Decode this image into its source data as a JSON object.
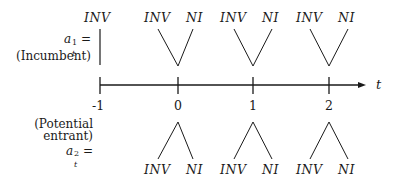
{
  "diagram": {
    "type": "timeline-game-tree",
    "axis": {
      "label": "t",
      "ticks": [
        "-1",
        "0",
        "1",
        "2"
      ]
    },
    "incumbent": {
      "label_line1": "a",
      "label_sup": "1",
      "label_sub": "t",
      "label_eq": "=",
      "label_line2": "(Incumbent)",
      "initial_action": "INV",
      "branches": [
        {
          "period": "0",
          "left": "INV",
          "right": "NI"
        },
        {
          "period": "1",
          "left": "INV",
          "right": "NI"
        },
        {
          "period": "2",
          "left": "INV",
          "right": "NI"
        }
      ]
    },
    "entrant": {
      "label_line1": "(Potential",
      "label_line2": "entrant)",
      "label_sym": "a",
      "label_sup": "2",
      "label_sub": "t",
      "label_eq": "=",
      "branches": [
        {
          "period": "0",
          "left": "INV",
          "right": "NI"
        },
        {
          "period": "1",
          "left": "INV",
          "right": "NI"
        },
        {
          "period": "2",
          "left": "INV",
          "right": "NI"
        }
      ]
    },
    "colors": {
      "ink": "#1a1a1a",
      "background": "#ffffff"
    }
  }
}
